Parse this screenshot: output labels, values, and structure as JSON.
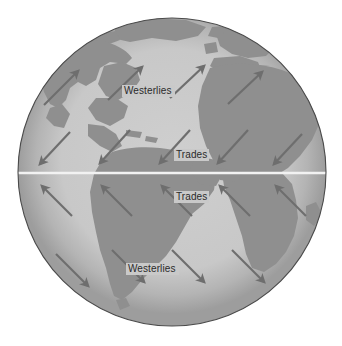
{
  "figure": {
    "name": "global-wind-belts-globe",
    "background_color": "#ffffff"
  },
  "globe": {
    "center_x": 172,
    "center_y": 172,
    "radius": 154,
    "ocean_color": "#c9c9c9",
    "land_color": "#8f8f8f",
    "rim_shadow_color": "#9a9a9a",
    "outline_color": "#4a4a4a"
  },
  "equator": {
    "label": "",
    "y": 173,
    "color": "#f2f2f2"
  },
  "arrows": {
    "color": "#6e6e6e",
    "stroke_width": 2.2
  },
  "labels": [
    {
      "text": "Westerlies",
      "x": 124,
      "y": 94,
      "belt": "northern-westerlies"
    },
    {
      "text": "Trades",
      "x": 176,
      "y": 158,
      "belt": "northeast-trades"
    },
    {
      "text": "Trades",
      "x": 176,
      "y": 200,
      "belt": "southeast-trades"
    },
    {
      "text": "Westerlies",
      "x": 128,
      "y": 272,
      "belt": "southern-westerlies"
    }
  ],
  "wind_vectors": [
    {
      "belt": "northern-westerlies",
      "x1": 44,
      "y1": 105,
      "x2": 78,
      "y2": 71
    },
    {
      "belt": "northern-westerlies",
      "x1": 108,
      "y1": 100,
      "x2": 142,
      "y2": 67
    },
    {
      "belt": "northern-westerlies",
      "x1": 170,
      "y1": 98,
      "x2": 204,
      "y2": 66
    },
    {
      "belt": "northern-westerlies",
      "x1": 228,
      "y1": 104,
      "x2": 262,
      "y2": 72
    },
    {
      "belt": "northeast-trades",
      "x1": 70,
      "y1": 132,
      "x2": 40,
      "y2": 164
    },
    {
      "belt": "northeast-trades",
      "x1": 130,
      "y1": 130,
      "x2": 100,
      "y2": 163
    },
    {
      "belt": "northeast-trades",
      "x1": 190,
      "y1": 130,
      "x2": 160,
      "y2": 163
    },
    {
      "belt": "northeast-trades",
      "x1": 248,
      "y1": 130,
      "x2": 218,
      "y2": 163
    },
    {
      "belt": "northeast-trades",
      "x1": 302,
      "y1": 134,
      "x2": 274,
      "y2": 164
    },
    {
      "belt": "southeast-trades",
      "x1": 72,
      "y1": 216,
      "x2": 42,
      "y2": 186
    },
    {
      "belt": "southeast-trades",
      "x1": 132,
      "y1": 216,
      "x2": 102,
      "y2": 186
    },
    {
      "belt": "southeast-trades",
      "x1": 192,
      "y1": 216,
      "x2": 162,
      "y2": 186
    },
    {
      "belt": "southeast-trades",
      "x1": 250,
      "y1": 216,
      "x2": 220,
      "y2": 186
    },
    {
      "belt": "southeast-trades",
      "x1": 306,
      "y1": 216,
      "x2": 276,
      "y2": 186
    },
    {
      "belt": "southern-westerlies",
      "x1": 56,
      "y1": 254,
      "x2": 88,
      "y2": 286
    },
    {
      "belt": "southern-westerlies",
      "x1": 112,
      "y1": 250,
      "x2": 144,
      "y2": 282
    },
    {
      "belt": "southern-westerlies",
      "x1": 172,
      "y1": 250,
      "x2": 204,
      "y2": 282
    },
    {
      "belt": "southern-westerlies",
      "x1": 232,
      "y1": 250,
      "x2": 264,
      "y2": 282
    }
  ],
  "landmasses": [
    {
      "name": "greenland"
    },
    {
      "name": "north-america"
    },
    {
      "name": "central-america"
    },
    {
      "name": "south-america"
    },
    {
      "name": "europe"
    },
    {
      "name": "africa"
    },
    {
      "name": "arabia-asia-edge"
    }
  ]
}
